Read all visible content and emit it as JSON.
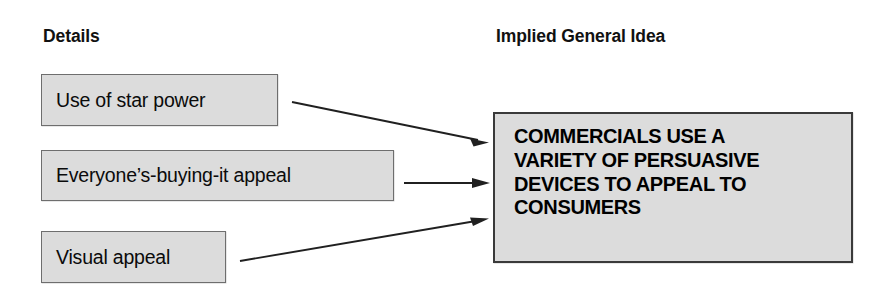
{
  "diagram": {
    "type": "implied-main-idea-map",
    "background_color": "#ffffff",
    "box_fill_color": "#dcdcdc",
    "box_border_color": "#6e6e6e",
    "main_box_border_color": "#3a3a3a",
    "arrow_color": "#202020",
    "columns": {
      "left_heading": "Details",
      "right_heading": "Implied General Idea"
    },
    "details": [
      {
        "id": "detail-1",
        "label": "Use of star power"
      },
      {
        "id": "detail-2",
        "label": "Everyone’s-buying-it appeal"
      },
      {
        "id": "detail-3",
        "label": "Visual appeal"
      }
    ],
    "main_idea": {
      "id": "main-idea",
      "label": "COMMERCIALS USE A VARIETY OF PERSUASIVE DEVICES TO APPEAL TO CONSUMERS",
      "lines": [
        "COMMERCIALS USE A",
        "VARIETY OF PERSUASIVE",
        "DEVICES TO APPEAL TO",
        "CONSUMERS"
      ]
    },
    "connectors": [
      {
        "id": "arrow-1",
        "from": "detail-1",
        "to": "main-idea",
        "shape": "diagonal-down-right"
      },
      {
        "id": "arrow-2",
        "from": "detail-2",
        "to": "main-idea",
        "shape": "horizontal"
      },
      {
        "id": "arrow-3",
        "from": "detail-3",
        "to": "main-idea",
        "shape": "diagonal-up-right"
      }
    ]
  }
}
